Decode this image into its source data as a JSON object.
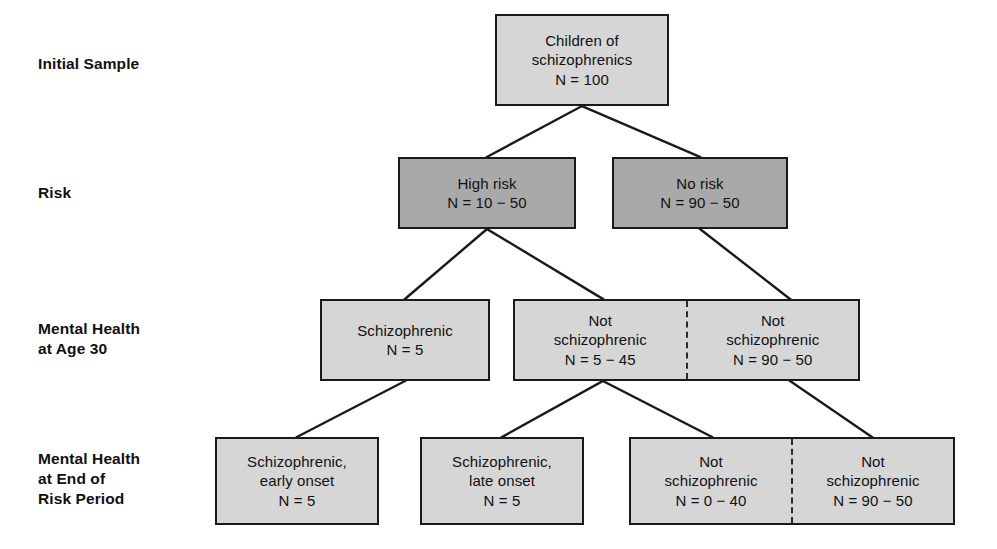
{
  "diagram": {
    "colors": {
      "box_light": "#d6d6d6",
      "box_dark": "#a9a9a9",
      "border": "#1a1a1a",
      "text": "#111111",
      "background": "#ffffff"
    }
  },
  "row_labels": [
    {
      "id": "initial-sample",
      "text": "Initial Sample"
    },
    {
      "id": "risk",
      "text": "Risk"
    },
    {
      "id": "mental-health-age-30",
      "text": "Mental Health\nat Age 30"
    },
    {
      "id": "mental-health-end-risk",
      "text": "Mental Health\nat End of\nRisk Period"
    }
  ],
  "nodes": {
    "initial": {
      "text": "Children of\nschizophrenics\nN = 100"
    },
    "high_risk": {
      "text": "High risk\nN = 10 − 50"
    },
    "no_risk": {
      "text": "No risk\nN = 90 − 50"
    },
    "schizophrenic_30": {
      "text": "Schizophrenic\nN = 5"
    },
    "not_schiz_30_left": {
      "text": "Not\nschizophrenic\nN = 5 − 45"
    },
    "not_schiz_30_right": {
      "text": "Not\nschizophrenic\nN = 90 − 50"
    },
    "schiz_early": {
      "text": "Schizophrenic,\nearly onset\nN = 5"
    },
    "schiz_late": {
      "text": "Schizophrenic,\nlate onset\nN = 5"
    },
    "not_schiz_end_left": {
      "text": "Not\nschizophrenic\nN = 0 − 40"
    },
    "not_schiz_end_right": {
      "text": "Not\nschizophrenic\nN = 90 − 50"
    }
  }
}
